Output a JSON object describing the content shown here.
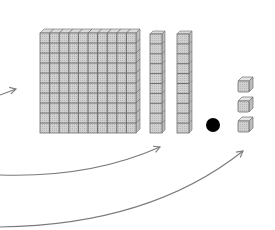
{
  "diagram": {
    "colors": {
      "block_fill": "#c8c8c8",
      "block_face": "#d9d9d9",
      "block_line": "#6e6e6e",
      "dot": "#000000",
      "arrow": "#7a7a7a"
    },
    "blocks": [
      {
        "kind": "hundred-flat",
        "count": 1,
        "grid": [
          10,
          10
        ]
      },
      {
        "kind": "ten-rod",
        "count": 2,
        "cells": 10
      },
      {
        "kind": "decimal-point",
        "count": 1
      },
      {
        "kind": "unit-cube",
        "count": 3
      }
    ],
    "arrows": [
      {
        "name": "arrow-to-flat",
        "target": "hundred-flat"
      },
      {
        "name": "arrow-to-rods",
        "target": "ten-rods"
      },
      {
        "name": "arrow-to-units",
        "target": "unit-cubes"
      }
    ]
  }
}
